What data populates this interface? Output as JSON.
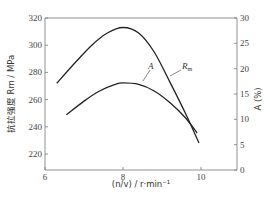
{
  "chart_data": {
    "type": "line",
    "title": "",
    "xlabel": "(n/v) / r·min⁻¹",
    "ylabel": "抗拉强度 Rm / MPa",
    "y2label": "A (%)",
    "xlim": [
      6,
      11
    ],
    "ylim": [
      208,
      320
    ],
    "y2lim": [
      0,
      30
    ],
    "x_ticks": [
      6,
      8,
      10
    ],
    "y_ticks": [
      220,
      240,
      260,
      280,
      300,
      320
    ],
    "y2_ticks": [
      0,
      5,
      10,
      15,
      20,
      25,
      30
    ],
    "grid": false,
    "legend": "inline labels",
    "series": [
      {
        "name": "Rm",
        "axis": "left",
        "x": [
          6.3,
          6.8,
          7.2,
          7.6,
          8.0,
          8.4,
          8.8,
          9.2,
          9.6,
          9.95
        ],
        "values": [
          272,
          288,
          300,
          309,
          313,
          309,
          295,
          273,
          250,
          228
        ]
      },
      {
        "name": "A",
        "axis": "right",
        "x": [
          6.55,
          7.0,
          7.4,
          7.8,
          8.0,
          8.4,
          8.8,
          9.2,
          9.6,
          9.9
        ],
        "values": [
          10.9,
          13.6,
          15.6,
          16.9,
          17.2,
          16.9,
          15.6,
          13.3,
          10.3,
          7.3
        ]
      }
    ]
  },
  "labels": {
    "x_axis_title": "(n/v) / r·min⁻¹",
    "y_axis_title": "抗拉强度 Rm / MPa",
    "y2_axis_title": "A (%)",
    "series_rm": "Rm",
    "series_a": "A"
  }
}
